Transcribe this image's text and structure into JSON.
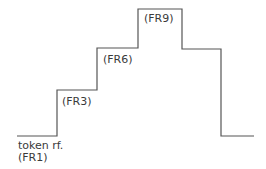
{
  "diagram": {
    "type": "step-profile",
    "line_color": "#555555",
    "points": [
      [
        17,
        136
      ],
      [
        57,
        136
      ],
      [
        57,
        90
      ],
      [
        97,
        90
      ],
      [
        97,
        48
      ],
      [
        138,
        48
      ],
      [
        138,
        9
      ],
      [
        182,
        9
      ],
      [
        182,
        49
      ],
      [
        221,
        49
      ],
      [
        221,
        136
      ],
      [
        254,
        136
      ]
    ],
    "labels": {
      "base_line1": "token rf.",
      "base_line2": "(FR1)",
      "step1": "(FR3)",
      "step2": "(FR6)",
      "step3": "(FR9)"
    }
  }
}
